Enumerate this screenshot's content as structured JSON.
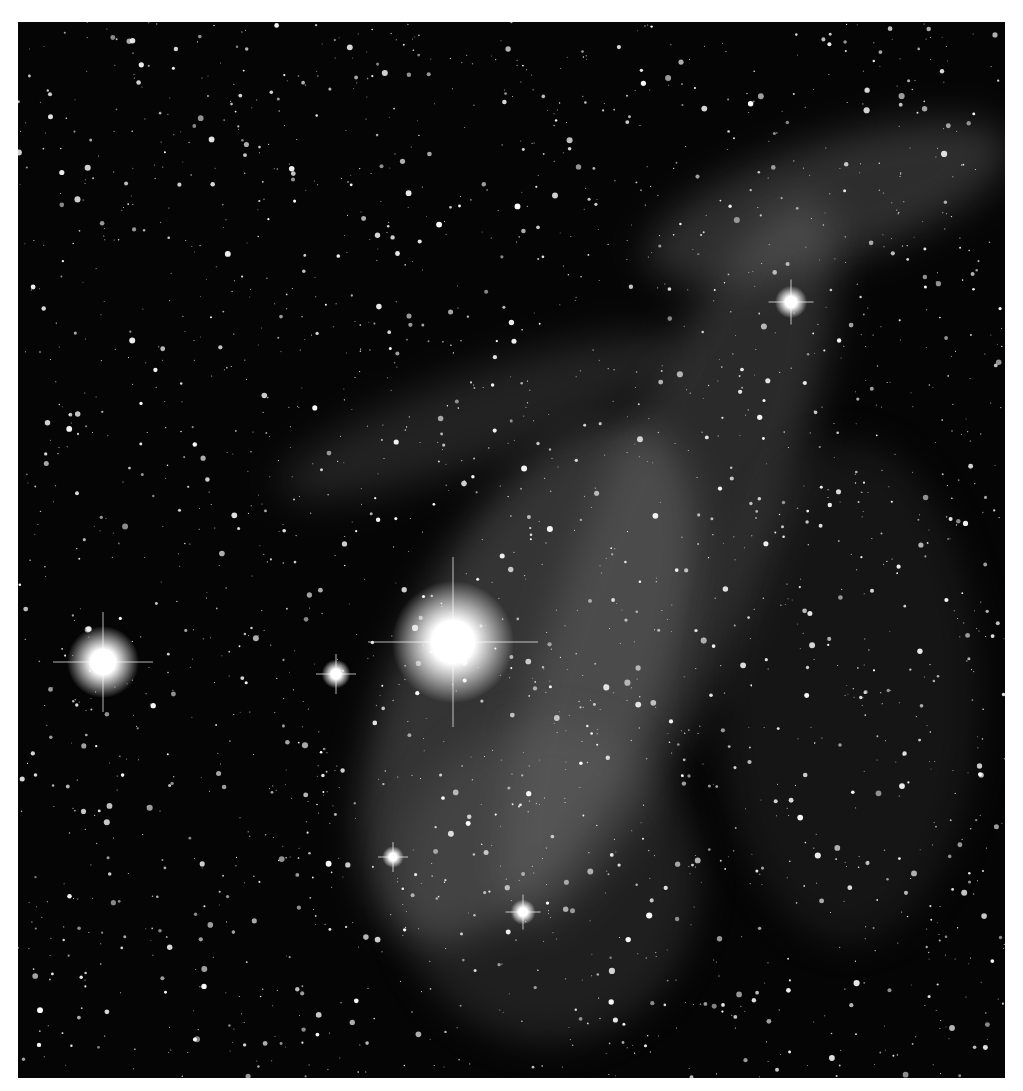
{
  "image": {
    "subject": "nebula-starfield",
    "description": "Grayscale astrophoto of filamentary emission nebula with dense starfield and bright stars",
    "colors": {
      "background": "#ffffff",
      "sky": "#050505",
      "nebula": "#8a8a8a",
      "star": "#ffffff"
    },
    "bright_stars": [
      {
        "x": 435,
        "y": 620,
        "r": 34
      },
      {
        "x": 85,
        "y": 640,
        "r": 20
      },
      {
        "x": 318,
        "y": 652,
        "r": 8
      },
      {
        "x": 773,
        "y": 280,
        "r": 9
      },
      {
        "x": 505,
        "y": 890,
        "r": 7
      },
      {
        "x": 375,
        "y": 835,
        "r": 6
      }
    ]
  }
}
